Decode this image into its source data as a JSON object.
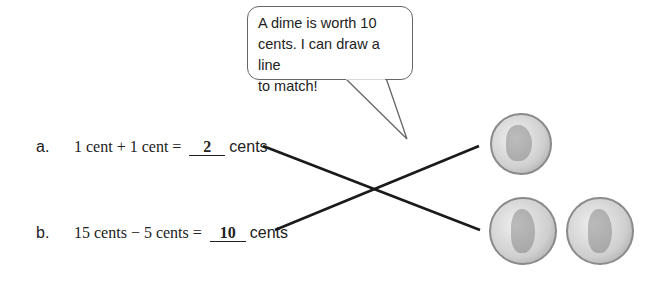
{
  "speech_bubble": {
    "text_line1": "A dime is worth 10",
    "text_line2": "cents.  I can draw a line",
    "text_line3": "to match!"
  },
  "problems": [
    {
      "label": "a.",
      "expression": "1 cent + 1 cent =",
      "answer": "2",
      "unit": "cents",
      "matched_to": "dime"
    },
    {
      "label": "b.",
      "expression": "15 cents − 5 cents =",
      "answer": "10",
      "unit": "cents",
      "matched_to": "two pennies"
    }
  ],
  "coins": [
    {
      "name": "dime",
      "icon": "dime-coin-icon"
    },
    {
      "name": "penny",
      "icon": "penny-coin-icon"
    },
    {
      "name": "penny",
      "icon": "penny-coin-icon"
    }
  ],
  "colors": {
    "line": "#1a1a1a",
    "bubble_border": "#666666",
    "coin": "#c8c8c8"
  }
}
